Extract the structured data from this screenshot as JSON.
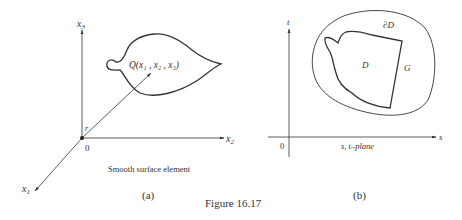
{
  "figure": {
    "caption": "Figure 16.17",
    "panel_a": {
      "sublabel": "(a)",
      "axis_x1": "x",
      "axis_x1_sub": "1",
      "axis_x2": "x",
      "axis_x2_sub": "2",
      "axis_x3": "x",
      "axis_x3_sub": "3",
      "origin": "0",
      "vector_label": "r",
      "point_label": "Q(x₁ , x₂ , x₃)",
      "surface_caption": "Smooth surface element"
    },
    "panel_b": {
      "sublabel": "(b)",
      "axis_s": "s",
      "axis_t": "t",
      "origin": "0",
      "plane_label": "s, t–plane",
      "boundary_label": "∂D",
      "region_label": "D",
      "outer_region_label": "G"
    },
    "colors": {
      "ink": "#333333",
      "background": "#ffffff"
    }
  }
}
